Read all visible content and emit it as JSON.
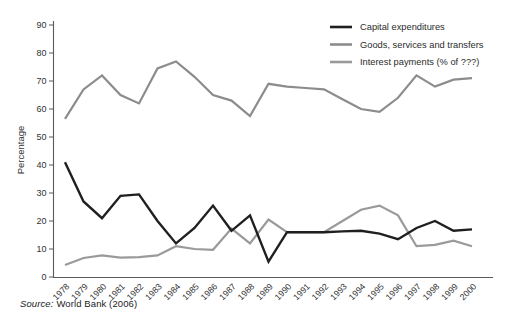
{
  "figure": {
    "source_label": "Source:",
    "source_text": "World Bank (2006)"
  },
  "chart_data": {
    "type": "line",
    "title": "",
    "xlabel": "",
    "ylabel": "Percentage",
    "ylim": [
      0,
      90
    ],
    "ytick_step": 10,
    "grid": false,
    "legend_position": "top-right",
    "x": [
      1978,
      1979,
      1980,
      1981,
      1982,
      1983,
      1984,
      1985,
      1986,
      1987,
      1988,
      1989,
      1990,
      1991,
      1992,
      1993,
      1994,
      1995,
      1996,
      1997,
      1998,
      1999,
      2000
    ],
    "series": [
      {
        "name": "Capital expenditures",
        "color": "#1f1f1f",
        "width": 2.4,
        "values": [
          41,
          27,
          21,
          29,
          29.5,
          20,
          12,
          17.5,
          25.5,
          16.5,
          22,
          5.5,
          16,
          16,
          16,
          16.3,
          16.5,
          15.5,
          13.5,
          17.5,
          20,
          16.5,
          17
        ]
      },
      {
        "name": "Goods, services and transfers",
        "color": "#8c8c8c",
        "width": 2.2,
        "values": [
          56.5,
          67,
          72,
          65,
          62,
          74.5,
          77,
          71.5,
          65,
          63,
          57.5,
          69,
          68,
          67.5,
          67,
          63.5,
          60,
          59,
          64,
          72,
          68,
          70.5,
          71
        ]
      },
      {
        "name": "Interest payments (% of ???)",
        "color": "#9a9a9a",
        "width": 2.2,
        "values": [
          4.3,
          6.8,
          7.7,
          6.9,
          7.1,
          7.7,
          11,
          10,
          9.7,
          17.3,
          12,
          20.5,
          16,
          16,
          16,
          20,
          24,
          25.5,
          22,
          11,
          11.5,
          13,
          11
        ]
      }
    ],
    "source": "World Bank (2006)"
  }
}
